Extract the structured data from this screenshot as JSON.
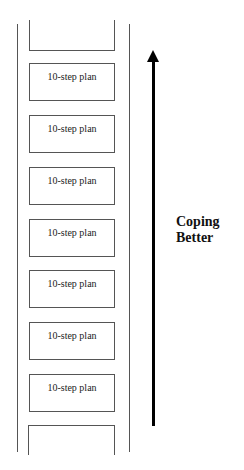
{
  "ladder": {
    "rungs": [
      {
        "label": "10-step plan"
      },
      {
        "label": "10-step plan"
      },
      {
        "label": "10-step plan"
      },
      {
        "label": "10-step plan"
      },
      {
        "label": "10-step plan"
      },
      {
        "label": "10-step plan"
      },
      {
        "label": "10-step plan"
      }
    ]
  },
  "arrow": {
    "direction": "up",
    "label_line1": "Coping",
    "label_line2": "Better"
  }
}
